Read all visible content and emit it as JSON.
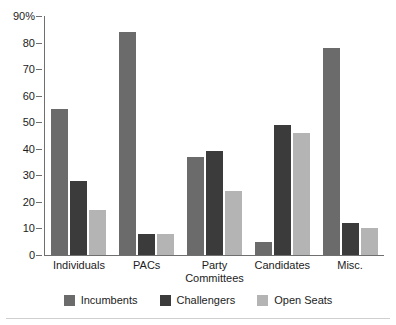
{
  "chart_data": {
    "type": "bar",
    "title": "",
    "xlabel": "",
    "ylabel": "",
    "ylim": [
      0,
      90
    ],
    "yticks": [
      0,
      10,
      20,
      30,
      40,
      50,
      60,
      70,
      80,
      90
    ],
    "ytick_labels": [
      "0",
      "10",
      "20",
      "30",
      "40",
      "50",
      "60",
      "70",
      "80",
      "90%"
    ],
    "grid": false,
    "legend_position": "bottom",
    "categories": [
      "Individuals",
      "PACs",
      "Party\nCommittees",
      "Candidates",
      "Misc."
    ],
    "series": [
      {
        "name": "Incumbents",
        "color": "#6b6b6b",
        "values": [
          55,
          84,
          37,
          5,
          78
        ]
      },
      {
        "name": "Challengers",
        "color": "#3b3b3b",
        "values": [
          28,
          8,
          39,
          49,
          12
        ]
      },
      {
        "name": "Open Seats",
        "color": "#b4b4b4",
        "values": [
          17,
          8,
          24,
          46,
          10
        ]
      }
    ]
  }
}
